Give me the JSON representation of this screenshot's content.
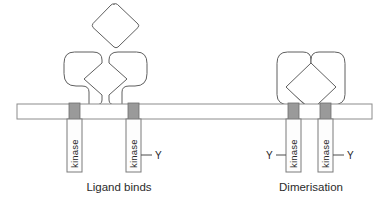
{
  "figure": {
    "background_color": "#ffffff",
    "outline_color": "#5f5f5f",
    "membrane_color": "#ffffff",
    "membrane_border_color": "#8c8c8c",
    "transmembrane_color": "#9a9a9a",
    "text_color": "#262626"
  },
  "panels": [
    {
      "id": "ligand-binds",
      "caption": "Ligand binds",
      "caption_x": 119,
      "caption_y": 191,
      "ligand": {
        "name": "ligand-diamond",
        "state": "unbound",
        "center_x": 114,
        "center_y": 26,
        "half_width": 26,
        "half_height": 24
      },
      "receptors": [
        {
          "name": "receptor-left",
          "orientation": "left",
          "stem_x": 76,
          "kinase_label": "kinase",
          "tail": null
        },
        {
          "name": "receptor-right",
          "orientation": "right",
          "stem_x": 135,
          "kinase_label": "kinase",
          "tail": {
            "label": "Y",
            "side": "right"
          }
        }
      ]
    },
    {
      "id": "dimerisation",
      "caption": "Dimerisation",
      "caption_x": 311,
      "caption_y": 191,
      "ligand": {
        "name": "ligand-diamond-bound",
        "state": "bound",
        "center_x": 311,
        "center_y": 85,
        "half_width": 30,
        "half_height": 29
      },
      "receptors": [
        {
          "name": "receptor-dimer-left",
          "orientation": "left",
          "stem_x": 295,
          "kinase_label": "kinase",
          "tail": {
            "label": "Y",
            "side": "left"
          }
        },
        {
          "name": "receptor-dimer-right",
          "orientation": "right",
          "stem_x": 327,
          "kinase_label": "kinase",
          "tail": {
            "label": "Y",
            "side": "right"
          }
        }
      ]
    }
  ],
  "membrane": {
    "name": "cell-membrane",
    "x": 17,
    "y": 104,
    "width": 355,
    "height": 15
  },
  "labels": {
    "kinase": "kinase",
    "phospho_tyrosine": "Y",
    "panel_one": "Ligand binds",
    "panel_two": "Dimerisation"
  }
}
